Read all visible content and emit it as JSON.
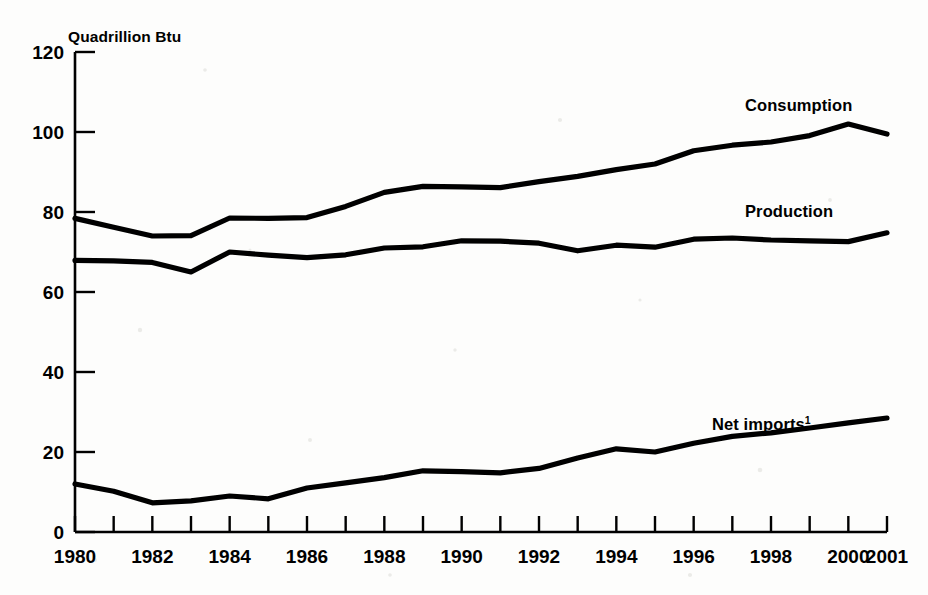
{
  "chart_data": {
    "type": "line",
    "title": "",
    "subtitle": "",
    "xlabel": "",
    "ylabel": "Quadrillion Btu",
    "unit_label": "Quadrillion Btu",
    "grid": false,
    "legend_position": "inline-right",
    "xlim": [
      1980,
      2001
    ],
    "ylim": [
      0,
      120
    ],
    "yticks": [
      0,
      20,
      40,
      60,
      80,
      100,
      120
    ],
    "ytick_labels": [
      "0",
      "20",
      "40",
      "60",
      "80",
      "100",
      "120"
    ],
    "x": [
      1980,
      1981,
      1982,
      1983,
      1984,
      1985,
      1986,
      1987,
      1988,
      1989,
      1990,
      1991,
      1992,
      1993,
      1994,
      1995,
      1996,
      1997,
      1998,
      1999,
      2000,
      2001
    ],
    "xticks": [
      1980,
      1981,
      1982,
      1983,
      1984,
      1985,
      1986,
      1987,
      1988,
      1989,
      1990,
      1991,
      1992,
      1993,
      1994,
      1995,
      1996,
      1997,
      1998,
      1999,
      2000,
      2001
    ],
    "xtick_labels": [
      "1980",
      "",
      "1982",
      "",
      "1984",
      "",
      "1986",
      "",
      "1988",
      "",
      "1990",
      "",
      "1992",
      "",
      "1994",
      "",
      "1996",
      "",
      "1998",
      "",
      "2000",
      "2001"
    ],
    "series": [
      {
        "name": "Consumption",
        "label": "Consumption",
        "color": "#000000",
        "values": [
          78.4,
          76.2,
          74.0,
          74.1,
          78.5,
          78.4,
          78.6,
          81.4,
          84.9,
          86.4,
          86.3,
          86.1,
          87.6,
          88.9,
          90.6,
          92.0,
          95.3,
          96.7,
          97.5,
          99.1,
          102.0,
          99.5
        ]
      },
      {
        "name": "Production",
        "label": "Production",
        "color": "#000000",
        "values": [
          67.9,
          67.8,
          67.4,
          65.0,
          70.0,
          69.2,
          68.6,
          69.3,
          71.0,
          71.3,
          72.8,
          72.7,
          72.2,
          70.3,
          71.7,
          71.2,
          73.2,
          73.5,
          73.0,
          72.8,
          72.6,
          74.8
        ]
      },
      {
        "name": "Net imports",
        "label": "Net imports",
        "label_superscript": "1",
        "color": "#000000",
        "values": [
          12.0,
          10.2,
          7.3,
          7.8,
          9.0,
          8.3,
          11.0,
          12.3,
          13.6,
          15.3,
          15.1,
          14.8,
          15.9,
          18.5,
          20.8,
          20.0,
          22.2,
          23.9,
          24.8,
          26.0,
          27.3,
          28.5
        ]
      }
    ],
    "annotations": [
      {
        "text": "Consumption",
        "x": 1996.2,
        "y": 106.5
      },
      {
        "text": "Production",
        "x": 1996.2,
        "y": 80.5
      },
      {
        "text": "Net imports",
        "x": 1995.4,
        "y": 33.5
      }
    ]
  }
}
